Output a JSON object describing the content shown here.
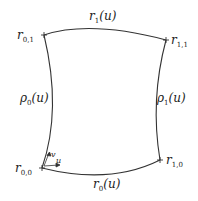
{
  "diagram": {
    "corners": {
      "r00": {
        "base": "r",
        "sub": "0,0"
      },
      "r01": {
        "base": "r",
        "sub": "0,1"
      },
      "r10": {
        "base": "r",
        "sub": "1,0"
      },
      "r11": {
        "base": "r",
        "sub": "1,1"
      }
    },
    "edges": {
      "top": {
        "base": "r",
        "sub": "1",
        "arg": "(u)"
      },
      "bottom": {
        "base": "r",
        "sub": "0",
        "arg": "(u)"
      },
      "left": {
        "base": "ρ",
        "sub": "0",
        "arg": "(u)"
      },
      "right": {
        "base": "ρ",
        "sub": "1",
        "arg": "(u)"
      }
    },
    "axes": {
      "u": "u",
      "v": "v"
    },
    "stroke_color": "#333333"
  }
}
